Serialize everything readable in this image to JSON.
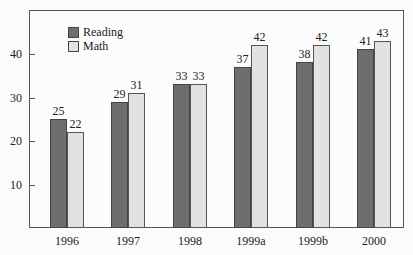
{
  "chart_data": {
    "type": "bar",
    "title": "",
    "xlabel": "",
    "ylabel": "",
    "ylim": [
      0,
      50
    ],
    "yticks": [
      10,
      20,
      30,
      40
    ],
    "categories": [
      "1996",
      "1997",
      "1998",
      "1999a",
      "1999b",
      "2000"
    ],
    "series": [
      {
        "name": "Reading",
        "color": "#6e6e6e",
        "values": [
          25,
          29,
          33,
          37,
          38,
          41
        ]
      },
      {
        "name": "Math",
        "color": "#e2e2e2",
        "values": [
          22,
          31,
          33,
          42,
          42,
          43
        ]
      }
    ],
    "legend_position": "top-left",
    "grid": false,
    "data_labels": true
  },
  "legend": {
    "reading_label": "Reading",
    "math_label": "Math"
  },
  "yticks": {
    "t10": "10",
    "t20": "20",
    "t30": "30",
    "t40": "40"
  }
}
